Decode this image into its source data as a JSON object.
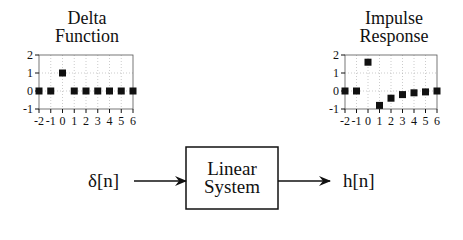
{
  "left_plot": {
    "title_line1": "Delta",
    "title_line2": "Function"
  },
  "right_plot": {
    "title_line1": "Impulse",
    "title_line2": "Response"
  },
  "system": {
    "input_label": "δ[n]",
    "box_line1": "Linear",
    "box_line2": "System",
    "output_label": "h[n]"
  },
  "chart_data": [
    {
      "type": "scatter",
      "title": "Delta Function",
      "x": [
        -2,
        -1,
        0,
        1,
        2,
        3,
        4,
        5,
        6
      ],
      "values": [
        0,
        0,
        1,
        0,
        0,
        0,
        0,
        0,
        0
      ],
      "xlabel": "",
      "ylabel": "",
      "xlim": [
        -2,
        6
      ],
      "ylim": [
        -1,
        2
      ],
      "x_ticks": [
        "-2",
        "-1",
        "0",
        "1",
        "2",
        "3",
        "4",
        "5",
        "6"
      ],
      "y_ticks": [
        "-1",
        "0",
        "1",
        "2"
      ],
      "grid": true
    },
    {
      "type": "scatter",
      "title": "Impulse Response",
      "x": [
        -2,
        -1,
        0,
        1,
        2,
        3,
        4,
        5,
        6
      ],
      "values": [
        0,
        0,
        1.6,
        -0.8,
        -0.4,
        -0.2,
        -0.1,
        -0.05,
        0
      ],
      "xlabel": "",
      "ylabel": "",
      "xlim": [
        -2,
        6
      ],
      "ylim": [
        -1,
        2
      ],
      "x_ticks": [
        "-2",
        "-1",
        "0",
        "1",
        "2",
        "3",
        "4",
        "5",
        "6"
      ],
      "y_ticks": [
        "-1",
        "0",
        "1",
        "2"
      ],
      "grid": true
    }
  ]
}
